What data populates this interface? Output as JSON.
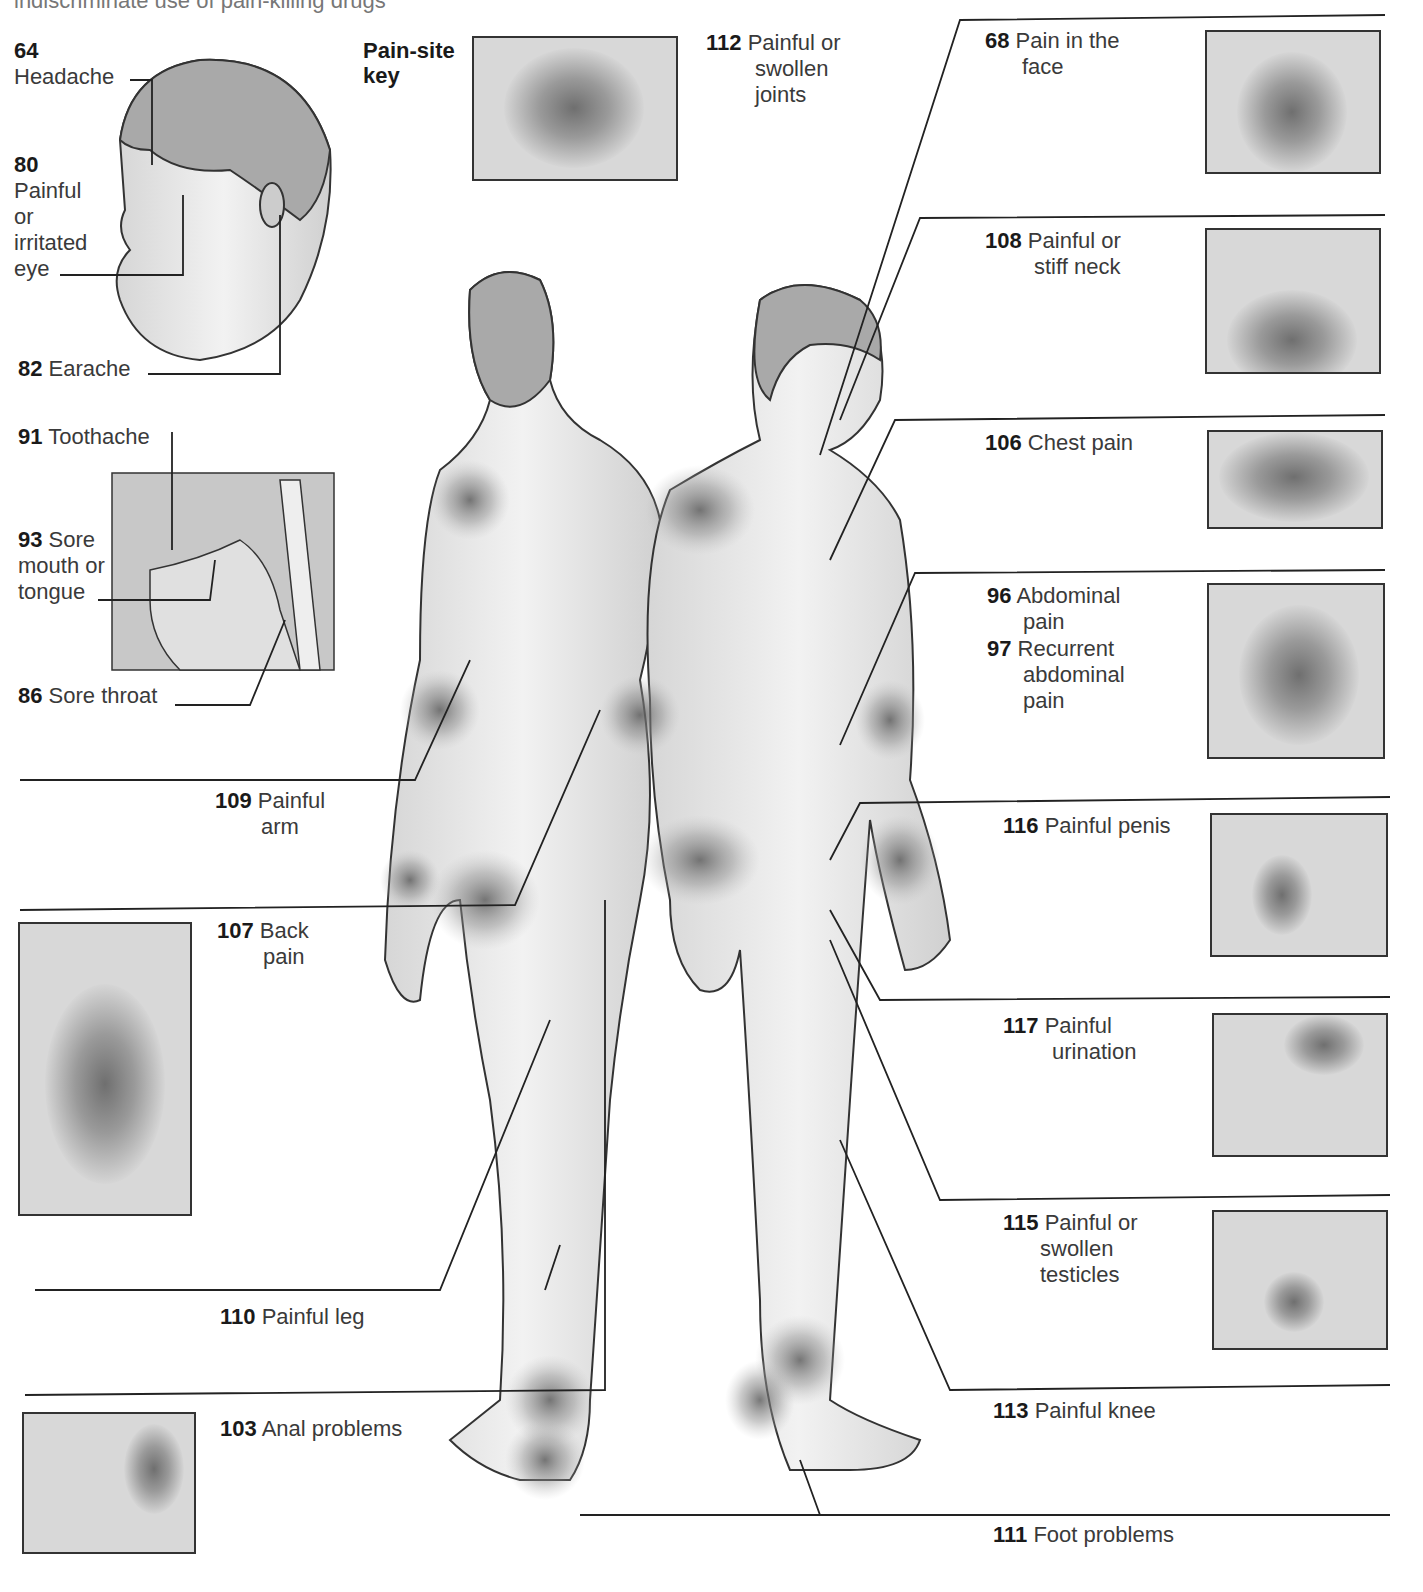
{
  "intro_text": "indiscriminate use of pain-killing drugs",
  "key": {
    "title_line1": "Pain-site",
    "title_line2": "key"
  },
  "labels": {
    "headache": {
      "num": "64",
      "text": "Headache"
    },
    "eye": {
      "num": "80",
      "lines": [
        "Painful",
        "or",
        "irritated",
        "eye"
      ]
    },
    "earache": {
      "num": "82",
      "text": "Earache"
    },
    "toothache": {
      "num": "91",
      "text": "Toothache"
    },
    "mouth": {
      "num": "93",
      "lines": [
        "Sore",
        "mouth or",
        "tongue"
      ]
    },
    "throat": {
      "num": "86",
      "text": "Sore throat"
    },
    "arm": {
      "num": "109",
      "lines": [
        "Painful",
        "arm"
      ]
    },
    "back": {
      "num": "107",
      "lines": [
        "Back",
        "pain"
      ]
    },
    "leg": {
      "num": "110",
      "text": "Painful leg"
    },
    "anal": {
      "num": "103",
      "text": "Anal problems"
    },
    "joints": {
      "num": "112",
      "lines": [
        "Painful or",
        "swollen",
        "joints"
      ]
    },
    "face": {
      "num": "68",
      "lines": [
        "Pain in the",
        "face"
      ]
    },
    "neck": {
      "num": "108",
      "lines": [
        "Painful or",
        "stiff neck"
      ]
    },
    "chest": {
      "num": "106",
      "text": "Chest pain"
    },
    "abdominal": {
      "num": "96",
      "lines": [
        "Abdominal",
        "pain"
      ]
    },
    "recurrent": {
      "num": "97",
      "lines": [
        "Recurrent",
        "abdominal",
        "pain"
      ]
    },
    "penis": {
      "num": "116",
      "text": "Painful penis"
    },
    "urination": {
      "num": "117",
      "lines": [
        "Painful",
        "urination"
      ]
    },
    "testicles": {
      "num": "115",
      "lines": [
        "Painful or",
        "swollen",
        "testicles"
      ]
    },
    "knee": {
      "num": "113",
      "text": "Painful knee"
    },
    "foot": {
      "num": "111",
      "text": "Foot problems"
    }
  }
}
